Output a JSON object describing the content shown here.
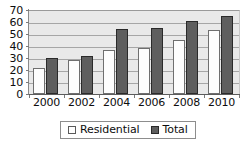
{
  "chart_data": {
    "type": "bar",
    "title": "",
    "subtitle": "",
    "xlabel": "",
    "ylabel": "",
    "categories": [
      "2000",
      "2002",
      "2004",
      "2006",
      "2008",
      "2010"
    ],
    "series": [
      {
        "name": "Residential",
        "values": [
          22,
          28,
          37,
          38,
          45,
          53
        ],
        "color": "#ffffff",
        "edge_color": "#6f6f6f"
      },
      {
        "name": "Total",
        "values": [
          30,
          32,
          54,
          55,
          61,
          65
        ],
        "color": "#5e5e5e",
        "edge_color": "#2a2a2a"
      }
    ],
    "ylim": [
      0,
      70
    ],
    "ytick_labels": [
      "0",
      "10",
      "20",
      "30",
      "40",
      "50",
      "60",
      "70"
    ],
    "ytick_values": [
      0,
      10,
      20,
      30,
      40,
      50,
      60,
      70
    ],
    "grid": true,
    "grid_axis": "y",
    "legend_position": "bottom-center",
    "legend_entries": [
      "Residential",
      "Total"
    ],
    "plot_background": "#e9e9e9",
    "gridline_color": "#a6a6a6",
    "annotations": []
  }
}
